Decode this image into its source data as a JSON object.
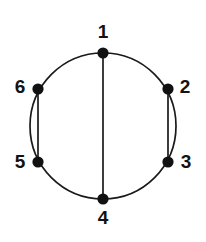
{
  "figure": {
    "kind": "graph-diagram",
    "background_color": "#ffffff",
    "stroke_color": "#1a1a1a",
    "vertex_fill_color": "#111111",
    "label_color": "#131313"
  },
  "circle": {
    "center_x": 103,
    "center_y": 126,
    "radius": 73,
    "stroke_width": 1.7
  },
  "vertices": [
    {
      "id": "1",
      "label": "1",
      "x": 103,
      "y": 53,
      "radius": 5.6,
      "label_x": 103,
      "label_y": 33,
      "label_anchor": "center"
    },
    {
      "id": "2",
      "label": "2",
      "x": 168,
      "y": 89,
      "radius": 5.6,
      "label_x": 185,
      "label_y": 88,
      "label_anchor": "center"
    },
    {
      "id": "3",
      "label": "3",
      "x": 168,
      "y": 162,
      "radius": 5.6,
      "label_x": 186,
      "label_y": 163,
      "label_anchor": "center"
    },
    {
      "id": "4",
      "label": "4",
      "x": 103,
      "y": 199,
      "radius": 5.6,
      "label_x": 103,
      "label_y": 219,
      "label_anchor": "center"
    },
    {
      "id": "5",
      "label": "5",
      "x": 38,
      "y": 162,
      "radius": 5.6,
      "label_x": 20,
      "label_y": 163,
      "label_anchor": "center"
    },
    {
      "id": "6",
      "label": "6",
      "x": 38,
      "y": 89,
      "radius": 5.6,
      "label_x": 20,
      "label_y": 88,
      "label_anchor": "center"
    }
  ],
  "chords": [
    {
      "id": "chord-1-4",
      "from": "1",
      "to": "4",
      "x1": 103,
      "y1": 53,
      "x2": 103,
      "y2": 199
    },
    {
      "id": "chord-2-3",
      "from": "2",
      "to": "3",
      "x1": 168,
      "y1": 89,
      "x2": 168,
      "y2": 162
    },
    {
      "id": "chord-6-5",
      "from": "6",
      "to": "5",
      "x1": 38,
      "y1": 89,
      "x2": 38,
      "y2": 162
    }
  ],
  "edges_summary": {
    "cycle": [
      "1-2",
      "2-3",
      "3-4",
      "4-5",
      "5-6",
      "6-1"
    ],
    "straight_chords": [
      "1-4",
      "2-3",
      "6-5"
    ],
    "double_edges": [
      "2-3",
      "6-5"
    ]
  }
}
